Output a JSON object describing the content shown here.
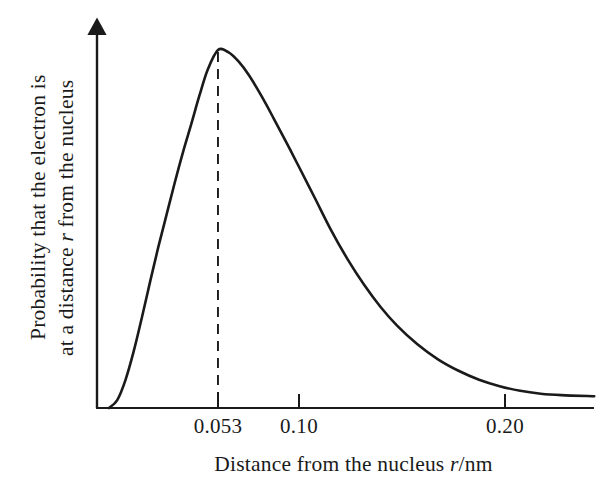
{
  "figure": {
    "background_color": "#ffffff",
    "ink_color": "#1a1a1a"
  },
  "axes": {
    "y_axis_label_line_1": "Probability that the electron is",
    "y_axis_label_line_2_before": "at a distance ",
    "y_axis_label_symbol": "r",
    "y_axis_label_line_2_after": " from the nucleus",
    "x_axis_label_before": "Distance from the nucleus ",
    "x_axis_label_symbol": "r",
    "x_axis_label_after": "/nm",
    "x_tick_labels": [
      "0.053",
      "0.10",
      "0.20"
    ]
  },
  "annotations": {
    "peak_marker": "dashed vertical line at most probable radius"
  },
  "chart_data": {
    "type": "line",
    "title": "",
    "subtitle": "",
    "xlabel": "Distance from the nucleus r/nm",
    "ylabel": "Probability that the electron is at a distance r from the nucleus",
    "grid": false,
    "legend": false,
    "xlim": [
      0,
      0.236
    ],
    "ylim": [
      0,
      1.05
    ],
    "xticks": [
      0.053,
      0.1,
      0.2
    ],
    "xticklabels": [
      "0.053",
      "0.10",
      "0.20"
    ],
    "yticks": [],
    "yticklabels": [],
    "annotations": [
      {
        "type": "vline",
        "style": "dashed",
        "x": 0.053,
        "y_from": 0,
        "y_to": 1.0,
        "label": "0.053"
      }
    ],
    "series": [
      {
        "name": "radial probability distribution",
        "color": "#1a1a1a",
        "x": [
          0.0,
          0.004,
          0.008,
          0.012,
          0.016,
          0.02,
          0.024,
          0.028,
          0.032,
          0.036,
          0.04,
          0.044,
          0.048,
          0.053,
          0.058,
          0.063,
          0.068,
          0.074,
          0.08,
          0.086,
          0.092,
          0.1,
          0.108,
          0.116,
          0.124,
          0.132,
          0.14,
          0.15,
          0.16,
          0.17,
          0.18,
          0.19,
          0.2,
          0.21,
          0.22,
          0.236
        ],
        "y": [
          0.0,
          0.022,
          0.078,
          0.158,
          0.253,
          0.353,
          0.45,
          0.54,
          0.63,
          0.715,
          0.793,
          0.873,
          0.945,
          1.0,
          0.994,
          0.968,
          0.93,
          0.873,
          0.81,
          0.745,
          0.678,
          0.588,
          0.497,
          0.416,
          0.345,
          0.283,
          0.231,
          0.178,
          0.136,
          0.104,
          0.079,
          0.061,
          0.048,
          0.04,
          0.036,
          0.033
        ]
      }
    ]
  }
}
